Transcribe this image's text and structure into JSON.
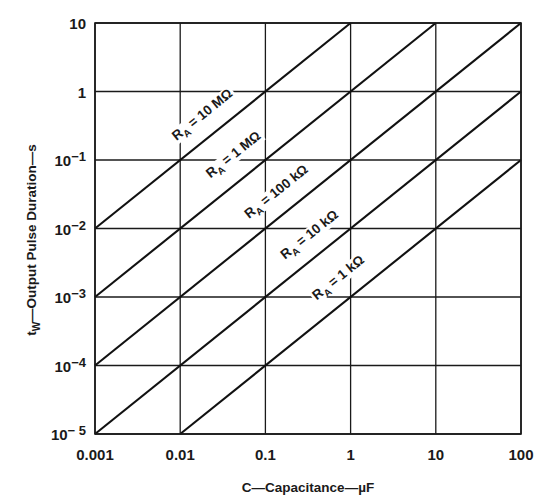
{
  "chart_data": {
    "type": "line",
    "title": "",
    "xlabel": "C—Capacitance—µF",
    "ylabel_main": "t",
    "ylabel_sub": "W",
    "ylabel_rest": "—Output Pulse Duration—s",
    "xscale": "log",
    "yscale": "log",
    "xlim": [
      0.001,
      100
    ],
    "ylim": [
      1e-05,
      10
    ],
    "grid": true,
    "legend": "inline labels on lines",
    "x_ticks": [
      {
        "value": 0.001,
        "label": "0.001"
      },
      {
        "value": 0.01,
        "label": "0.01"
      },
      {
        "value": 0.1,
        "label": "0.1"
      },
      {
        "value": 1,
        "label": "1"
      },
      {
        "value": 10,
        "label": "10"
      },
      {
        "value": 100,
        "label": "100"
      }
    ],
    "y_ticks": [
      {
        "value": 10,
        "base": "10",
        "exp": ""
      },
      {
        "value": 1,
        "base": "1",
        "exp": ""
      },
      {
        "value": 0.1,
        "base": "10",
        "exp": "−1"
      },
      {
        "value": 0.01,
        "base": "10",
        "exp": "−2"
      },
      {
        "value": 0.001,
        "base": "10",
        "exp": "−3"
      },
      {
        "value": 0.0001,
        "base": "10",
        "exp": "−4"
      },
      {
        "value": 1e-05,
        "base": "10",
        "exp": "− 5"
      }
    ],
    "series": [
      {
        "name": "RA = 10 MΩ",
        "label_main": "R",
        "label_sub": "A",
        "label_rest": " = 10 MΩ",
        "resistance_ohm": 10000000,
        "points": [
          [
            0.001,
            0.01
          ],
          [
            1,
            10
          ]
        ],
        "label_pos": [
          205,
          118
        ]
      },
      {
        "name": "RA = 1 MΩ",
        "label_main": "R",
        "label_sub": "A",
        "label_rest": " = 1 MΩ",
        "resistance_ohm": 1000000,
        "points": [
          [
            0.001,
            0.001
          ],
          [
            10,
            10
          ]
        ],
        "label_pos": [
          236,
          158
        ]
      },
      {
        "name": "RA = 100 kΩ",
        "label_main": "R",
        "label_sub": "A",
        "label_rest": " = 100 kΩ",
        "resistance_ohm": 100000,
        "points": [
          [
            0.001,
            0.0001
          ],
          [
            100,
            10
          ]
        ],
        "label_pos": [
          279,
          195
        ]
      },
      {
        "name": "RA = 10 kΩ",
        "label_main": "R",
        "label_sub": "A",
        "label_rest": " = 10 kΩ",
        "resistance_ohm": 10000,
        "points": [
          [
            0.001,
            1e-05
          ],
          [
            100,
            1
          ]
        ],
        "label_pos": [
          312,
          238
        ]
      },
      {
        "name": "RA = 1 kΩ",
        "label_main": "R",
        "label_sub": "A",
        "label_rest": " = 1 kΩ",
        "resistance_ohm": 1000,
        "points": [
          [
            0.01,
            1e-05
          ],
          [
            100,
            0.1
          ]
        ],
        "label_pos": [
          341,
          281
        ]
      }
    ],
    "relationship": "t_w ≈ 1.1 · R_A · C"
  },
  "layout": {
    "plot": {
      "left": 95,
      "top": 23,
      "right": 521,
      "bottom": 434
    },
    "colors": {
      "ink": "#1a1a1a",
      "background": "#ffffff"
    }
  }
}
